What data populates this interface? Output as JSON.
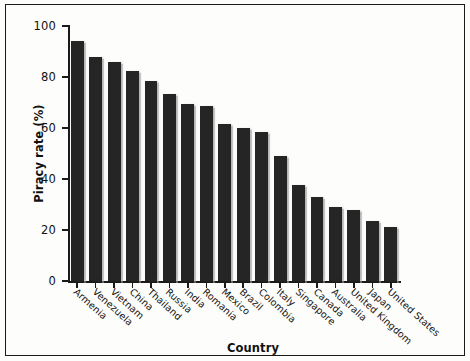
{
  "chart_data": {
    "type": "bar",
    "title": "",
    "xlabel": "Country",
    "ylabel": "Piracy rate (%)",
    "ylim": [
      0,
      100
    ],
    "yticks": [
      0,
      20,
      40,
      60,
      80,
      100
    ],
    "grid": false,
    "legend": null,
    "bar_color": "#252525",
    "background_color": "#fdfdfb",
    "axis_color": "#1a1a1a",
    "categories": [
      "Armenia",
      "Venezuela",
      "Vietnam",
      "China",
      "Thailand",
      "Russia",
      "India",
      "Romania",
      "Mexico",
      "Brazil",
      "Colombia",
      "Italy",
      "Singapore",
      "Canada",
      "Australia",
      "United Kingdom",
      "Japan",
      "United States"
    ],
    "values": [
      94,
      88,
      86,
      82.5,
      78.5,
      73.5,
      69.5,
      68.5,
      61.5,
      60,
      58.5,
      49,
      37.5,
      33,
      29,
      28,
      23.5,
      21
    ]
  }
}
